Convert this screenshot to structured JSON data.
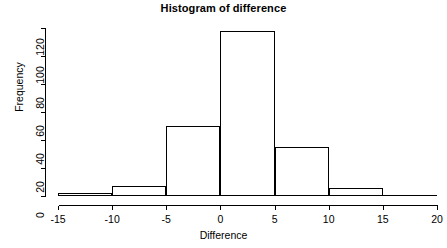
{
  "chart_data": {
    "type": "bar",
    "title": "Histogram of difference",
    "xlabel": "Difference",
    "ylabel": "Frequency",
    "bin_edges": [
      -15,
      -10,
      -5,
      0,
      5,
      10,
      15,
      20
    ],
    "categories": [
      "-15 to -10",
      "-10 to -5",
      "-5 to 0",
      "0 to 5",
      "5 to 10",
      "10 to 15",
      "15 to 20"
    ],
    "values": [
      2,
      7,
      50,
      118,
      35,
      6,
      1
    ],
    "xticks": [
      -15,
      -10,
      -5,
      0,
      5,
      10,
      15,
      20
    ],
    "xtick_labels": [
      "-15",
      "-10",
      "-5",
      "0",
      "5",
      "10",
      "15",
      "20"
    ],
    "yticks": [
      0,
      20,
      40,
      60,
      80,
      100,
      120
    ],
    "ytick_labels": [
      "0",
      "20",
      "40",
      "60",
      "80",
      "100",
      "120"
    ],
    "xlim": [
      -15,
      20
    ],
    "ylim": [
      0,
      120
    ],
    "grid": false,
    "legend": false,
    "bar_fill": "#ffffff",
    "bar_stroke": "#000000",
    "axis_color": "#000000",
    "background": "#ffffff"
  },
  "axis_titles": {
    "x": "Difference",
    "y": "Frequency"
  },
  "header": {
    "title": "Histogram of difference"
  }
}
